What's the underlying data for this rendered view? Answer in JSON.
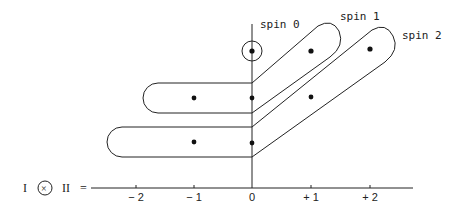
{
  "labels": {
    "spin0": "spin 0",
    "spin1": "spin 1",
    "spin2": "spin 2"
  },
  "equation": {
    "left": "I",
    "operator": "×",
    "right": "II",
    "equals": "="
  },
  "axis": {
    "ticks": [
      {
        "value": -2,
        "label": "− 2"
      },
      {
        "value": -1,
        "label": "− 1"
      },
      {
        "value": 0,
        "label": "0"
      },
      {
        "value": 1,
        "label": "+ 1"
      },
      {
        "value": 2,
        "label": "+ 2"
      }
    ]
  },
  "points": [
    {
      "m": 0,
      "row": 0,
      "group": "spin 0"
    },
    {
      "m": 1,
      "row": 0,
      "group": "spin 1"
    },
    {
      "m": 2,
      "row": 0,
      "group": "spin 2"
    },
    {
      "m": -1,
      "row": 1,
      "group": "spin 1"
    },
    {
      "m": 0,
      "row": 1,
      "group": "spin 1"
    },
    {
      "m": 1,
      "row": 1,
      "group": "spin 2"
    },
    {
      "m": -1,
      "row": 2,
      "group": "spin 2"
    },
    {
      "m": 0,
      "row": 2,
      "group": "spin 2"
    }
  ],
  "colors": {
    "ink": "#222222",
    "background": "#ffffff"
  }
}
